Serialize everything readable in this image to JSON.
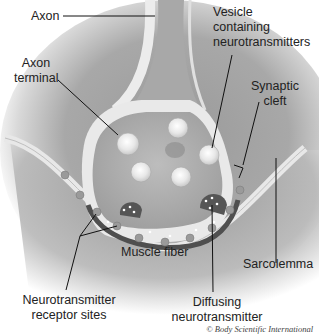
{
  "figure": {
    "labels": {
      "axon": "Axon",
      "axon_terminal_line1": "Axon",
      "axon_terminal_line2": "terminal",
      "vesicle_line1": "Vesicle",
      "vesicle_line2": "containing",
      "vesicle_line3": "neurotransmitters",
      "synaptic_cleft_line1": "Synaptic",
      "synaptic_cleft_line2": "cleft",
      "muscle_fiber": "Muscle fiber",
      "sarcolemma": "Sarcolemma",
      "receptor_line1": "Neurotransmitter",
      "receptor_line2": "receptor sites",
      "diffusing_line1": "Diffusing",
      "diffusing_line2": "neurotransmitter"
    },
    "credit": "© Body Scientific International",
    "colors": {
      "background": "#ffffff",
      "tissue_dark": "#8a8a8a",
      "membrane_light": "#e6e6e6",
      "cleft_dark": "#4a4a4a",
      "text": "#222222"
    }
  }
}
